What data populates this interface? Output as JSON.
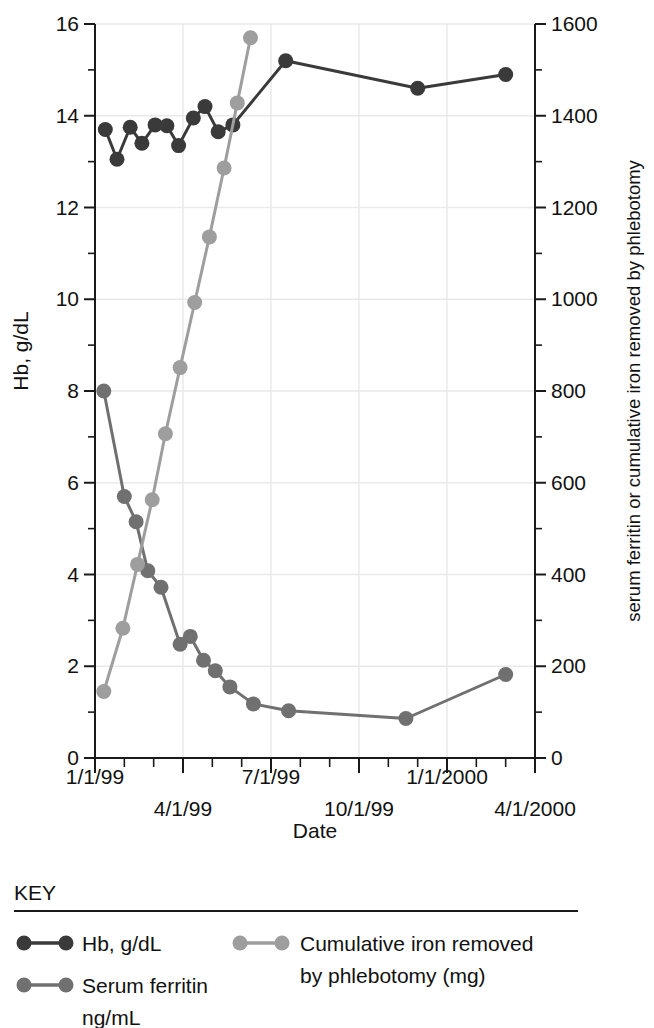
{
  "chart_data": {
    "type": "line",
    "title": "",
    "xlabel": "Date",
    "ylabel_left": "Hb, g/dL",
    "ylabel_right": "serum ferritin or cumulative iron removed by phlebotomy",
    "grid": true,
    "legend_position": "below",
    "x_axis": {
      "tick_labels_row1": [
        "1/1/99",
        "7/1/99",
        "1/1/2000"
      ],
      "tick_labels_row2": [
        "4/1/99",
        "10/1/99",
        "4/1/2000"
      ],
      "tick_labels_all": [
        "1/1/99",
        "4/1/99",
        "7/1/99",
        "10/1/99",
        "1/1/2000",
        "4/1/2000"
      ],
      "minor_tick_interval_months": 1,
      "range_start": "1/1/99",
      "range_end": "4/1/2000"
    },
    "y_axis_left": {
      "label": "Hb, g/dL",
      "ticks": [
        0,
        2,
        4,
        6,
        8,
        10,
        12,
        14,
        16
      ],
      "minor_tick_step": 1,
      "ylim": [
        0,
        16
      ]
    },
    "y_axis_right": {
      "label": "serum ferritin or cumulative iron removed by phlebotomy",
      "ticks": [
        0,
        200,
        400,
        600,
        800,
        1000,
        1200,
        1400,
        1600
      ],
      "minor_tick_step": 100,
      "ylim": [
        0,
        1600
      ]
    },
    "series": [
      {
        "name": "Hb, g/dL",
        "axis": "left",
        "units": "g/dL",
        "color": "#3a3a3a",
        "points": [
          {
            "x_months": 0.35,
            "y": 13.7
          },
          {
            "x_months": 0.75,
            "y": 13.05
          },
          {
            "x_months": 1.2,
            "y": 13.75
          },
          {
            "x_months": 1.6,
            "y": 13.4
          },
          {
            "x_months": 2.05,
            "y": 13.8
          },
          {
            "x_months": 2.45,
            "y": 13.78
          },
          {
            "x_months": 2.85,
            "y": 13.35
          },
          {
            "x_months": 3.35,
            "y": 13.95
          },
          {
            "x_months": 3.75,
            "y": 14.2
          },
          {
            "x_months": 4.2,
            "y": 13.65
          },
          {
            "x_months": 4.7,
            "y": 13.8
          },
          {
            "x_months": 6.5,
            "y": 15.2
          },
          {
            "x_months": 11.0,
            "y": 14.6
          },
          {
            "x_months": 14.0,
            "y": 14.9
          }
        ]
      },
      {
        "name": "Serum ferritin ng/mL",
        "axis": "right",
        "units": "ng/mL",
        "color": "#707070",
        "points": [
          {
            "x_months": 0.3,
            "y": 800
          },
          {
            "x_months": 1.0,
            "y": 570
          },
          {
            "x_months": 1.4,
            "y": 515
          },
          {
            "x_months": 1.8,
            "y": 408
          },
          {
            "x_months": 2.25,
            "y": 372
          },
          {
            "x_months": 2.9,
            "y": 248
          },
          {
            "x_months": 3.25,
            "y": 265
          },
          {
            "x_months": 3.7,
            "y": 213
          },
          {
            "x_months": 4.1,
            "y": 190
          },
          {
            "x_months": 4.6,
            "y": 155
          },
          {
            "x_months": 5.4,
            "y": 118
          },
          {
            "x_months": 6.6,
            "y": 103
          },
          {
            "x_months": 10.6,
            "y": 86
          },
          {
            "x_months": 14.0,
            "y": 182
          }
        ]
      },
      {
        "name": "Cumulative iron removed by phlebotomy (mg)",
        "axis": "right",
        "units": "mg",
        "color": "#9e9e9e",
        "points": [
          {
            "x_months": 0.3,
            "y": 145
          },
          {
            "x_months": 0.95,
            "y": 283
          },
          {
            "x_months": 1.45,
            "y": 422
          },
          {
            "x_months": 1.95,
            "y": 563
          },
          {
            "x_months": 2.4,
            "y": 707
          },
          {
            "x_months": 2.9,
            "y": 851
          },
          {
            "x_months": 3.4,
            "y": 993
          },
          {
            "x_months": 3.9,
            "y": 1136
          },
          {
            "x_months": 4.4,
            "y": 1286
          },
          {
            "x_months": 4.85,
            "y": 1428
          },
          {
            "x_months": 5.3,
            "y": 1570
          }
        ]
      }
    ]
  },
  "legend": {
    "title": "KEY",
    "entries": [
      {
        "label": "Hb, g/dL",
        "color": "#3a3a3a"
      },
      {
        "label": "Serum ferritin",
        "label2": "ng/mL",
        "color": "#707070"
      },
      {
        "label": "Cumulative iron removed",
        "label2": "by phlebotomy (mg)",
        "color": "#9e9e9e"
      }
    ]
  }
}
